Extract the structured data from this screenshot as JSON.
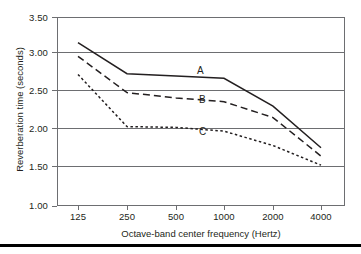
{
  "chart_data": {
    "type": "line",
    "title": "",
    "xlabel": "Octave-band center frequency (Hertz)",
    "ylabel": "Reverberation time (seconds)",
    "x": [
      125,
      250,
      500,
      1000,
      2000,
      4000
    ],
    "xtick_labels": [
      "125",
      "250",
      "500",
      "1000",
      "2000",
      "4000"
    ],
    "xscale": "log-octave",
    "ytick_labels": [
      "1.00",
      "1.50",
      "2.00",
      "2.50",
      "3.00",
      "3.50"
    ],
    "ytick_values": [
      1.0,
      1.5,
      2.0,
      2.5,
      3.0,
      3.5
    ],
    "ylim": [
      1.0,
      3.5
    ],
    "grid": "horizontal",
    "legend": "inline-labels",
    "series": [
      {
        "name": "A",
        "label": "A",
        "style": "solid",
        "color": "#231f20",
        "values": [
          3.16,
          2.75,
          2.72,
          2.69,
          2.32,
          1.77
        ]
      },
      {
        "name": "B",
        "label": "B",
        "style": "dashed",
        "color": "#231f20",
        "values": [
          2.98,
          2.5,
          2.43,
          2.38,
          2.17,
          1.66
        ]
      },
      {
        "name": "C",
        "label": "C",
        "style": "dotted",
        "color": "#231f20",
        "values": [
          2.74,
          2.05,
          2.04,
          1.99,
          1.8,
          1.54
        ]
      }
    ]
  },
  "axis": {
    "y_title": "Reverberation time (seconds)",
    "x_title": "Octave-band center frequency (Hertz)",
    "y_ticks": [
      "3.50",
      "3.00",
      "2.50",
      "2.00",
      "1.50",
      "1.00"
    ],
    "x_ticks": [
      "125",
      "250",
      "500",
      "1000",
      "2000",
      "4000"
    ]
  },
  "series_labels": {
    "a": "A",
    "b": "B",
    "c": "C"
  },
  "colors": {
    "line": "#231f20",
    "grid": "#6d6e71",
    "axis": "#6d6e71",
    "rule": "#000000",
    "background": "#ffffff"
  }
}
